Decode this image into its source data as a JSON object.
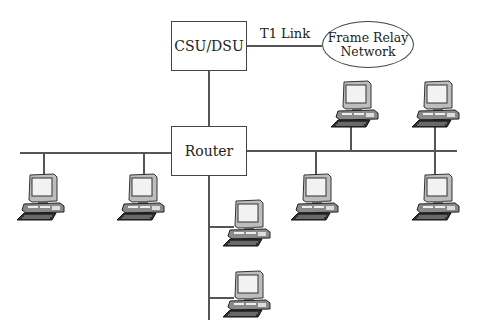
{
  "diagram": {
    "title": "",
    "nodes": {
      "csu_dsu": {
        "label": "CSU/DSU",
        "type": "box"
      },
      "frame_relay": {
        "line1": "Frame Relay",
        "line2": "Network",
        "type": "ellipse"
      },
      "router": {
        "label": "Router",
        "type": "box"
      }
    },
    "links": {
      "t1": {
        "label": "T1 Link",
        "from": "csu_dsu",
        "to": "frame_relay"
      },
      "csu_router": {
        "from": "csu_dsu",
        "to": "router"
      }
    },
    "workstations": [
      {
        "id": "pc1",
        "segment": "left-bus"
      },
      {
        "id": "pc2",
        "segment": "left-bus"
      },
      {
        "id": "pc3",
        "segment": "router-down"
      },
      {
        "id": "pc4",
        "segment": "router-down"
      },
      {
        "id": "pc5",
        "segment": "right-bus"
      },
      {
        "id": "pc6",
        "segment": "right-bus"
      },
      {
        "id": "pc7",
        "segment": "right-bus"
      },
      {
        "id": "pc8",
        "segment": "right-bus"
      }
    ],
    "colors": {
      "line": "#555555",
      "text": "#222222",
      "background": "#ffffff"
    }
  }
}
